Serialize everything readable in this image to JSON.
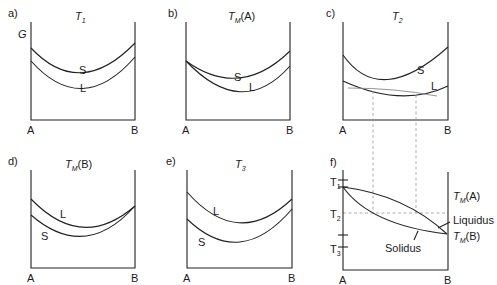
{
  "figure": {
    "panels": [
      {
        "id": "a",
        "label": "a)",
        "title_main": "T",
        "title_sub": "1",
        "title_suffix": "",
        "y_axis_label": "G",
        "x_left": "A",
        "x_right": "B",
        "curve_upper": "S",
        "curve_lower": "L"
      },
      {
        "id": "b",
        "label": "b)",
        "title_main": "T",
        "title_sub": "M",
        "title_suffix": "(A)",
        "x_left": "A",
        "x_right": "B",
        "curve_upper": "S",
        "curve_lower": "L"
      },
      {
        "id": "c",
        "label": "c)",
        "title_main": "T",
        "title_sub": "2",
        "title_suffix": "",
        "x_left": "A",
        "x_right": "B",
        "curve_upper": "S",
        "curve_lower": "L"
      },
      {
        "id": "d",
        "label": "d)",
        "title_main": "T",
        "title_sub": "M",
        "title_suffix": "(B)",
        "x_left": "A",
        "x_right": "B",
        "curve_upper": "L",
        "curve_lower": "S"
      },
      {
        "id": "e",
        "label": "e)",
        "title_main": "T",
        "title_sub": "3",
        "title_suffix": "",
        "x_left": "A",
        "x_right": "B",
        "curve_upper": "L",
        "curve_lower": "S"
      },
      {
        "id": "f",
        "label": "f)",
        "x_left": "A",
        "x_right": "B",
        "y_ticks": [
          {
            "main": "T",
            "sub": "1"
          },
          {
            "main": "T",
            "sub": "2"
          },
          {
            "main": "T",
            "sub": "3"
          }
        ],
        "right_top_main": "T",
        "right_top_sub": "M",
        "right_top_suffix": "(A)",
        "right_bottom_main": "T",
        "right_bottom_sub": "M",
        "right_bottom_suffix": "(B)",
        "liquidus_label": "Liquidus",
        "solidus_label": "Solidus"
      }
    ]
  }
}
